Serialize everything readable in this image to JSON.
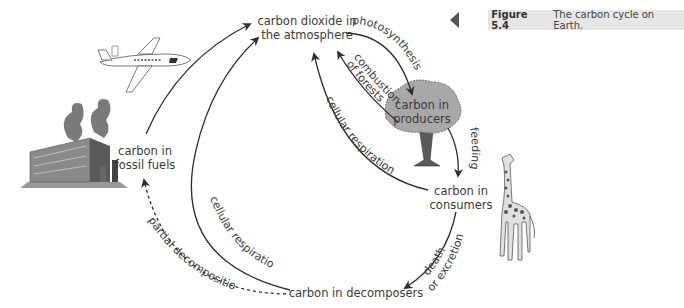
{
  "caption": {
    "figure_label": "Figure 5.4",
    "text": "The carbon cycle on Earth."
  },
  "nodes": {
    "atmosphere": {
      "line1": "carbon dioxide in",
      "line2": "the atmosphere"
    },
    "producers": {
      "line1": "carbon in",
      "line2": "producers"
    },
    "consumers": {
      "line1": "carbon in",
      "line2": "consumers"
    },
    "fossil_fuels": {
      "line1": "carbon in",
      "line2": "fossil fuels"
    },
    "decomposers": {
      "line1": "carbon in decomposers"
    }
  },
  "processes": {
    "photosynthesis": "photosynthesis",
    "combustion_line1": "combustion",
    "combustion_line2": "of forests",
    "cellular_respiration_consumers": "cellular respiration",
    "feeding": "feeding",
    "death_line1": "death",
    "death_line2": "or excretion",
    "cellular_respiration_decomposers": "cellular respiration",
    "partial_decomposition": "partial decomposition"
  },
  "illustrations": [
    "airplane-illustration",
    "factory-illustration",
    "tree-illustration",
    "giraffe-illustration"
  ],
  "colors": {
    "line": "#2e2e2e",
    "tree_canopy": "#a8a8a8",
    "caption_bg": "#e6e6e6",
    "text": "#3a3a3a"
  }
}
